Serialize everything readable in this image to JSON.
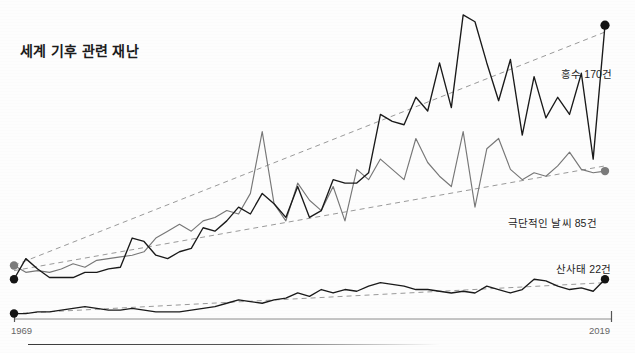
{
  "chart_title": "세계 기후 관련 재난",
  "axis": {
    "start_year_label": "1969",
    "end_year_label": "2019",
    "xlim": [
      1969,
      2019
    ],
    "ylim": [
      0,
      180
    ]
  },
  "labels": {
    "flood": "홍수 170건",
    "extreme_weather": "극단적인 날씨 85건",
    "landslide": "산사태 22건"
  },
  "colors": {
    "flood_line": "#1a1a1a",
    "extreme_weather_line": "#777777",
    "landslide_line": "#1a1a1a",
    "trend_line": "#9a9a9a",
    "axis_text": "#666666",
    "title_text": "#1b1b1b",
    "background": "#fdfdfd"
  },
  "chart_data": {
    "type": "line",
    "title": "세계 기후 관련 재난",
    "xlabel": "",
    "ylabel": "",
    "xlim": [
      1969,
      2019
    ],
    "ylim": [
      0,
      180
    ],
    "grid": false,
    "legend_position": "right-inline-endpoint-labels",
    "x": [
      1969,
      1970,
      1971,
      1972,
      1973,
      1974,
      1975,
      1976,
      1977,
      1978,
      1979,
      1980,
      1981,
      1982,
      1983,
      1984,
      1985,
      1986,
      1987,
      1988,
      1989,
      1990,
      1991,
      1992,
      1993,
      1994,
      1995,
      1996,
      1997,
      1998,
      1999,
      2000,
      2001,
      2002,
      2003,
      2004,
      2005,
      2006,
      2007,
      2008,
      2009,
      2010,
      2011,
      2012,
      2013,
      2014,
      2015,
      2016,
      2017,
      2018,
      2019
    ],
    "series": [
      {
        "name": "홍수",
        "label": "홍수 170건",
        "end_value": 170,
        "color": "#1a1a1a",
        "values": [
          22,
          34,
          28,
          23,
          23,
          23,
          26,
          26,
          28,
          29,
          46,
          44,
          36,
          34,
          38,
          40,
          52,
          50,
          56,
          64,
          60,
          72,
          66,
          58,
          76,
          58,
          62,
          80,
          78,
          78,
          84,
          118,
          114,
          112,
          128,
          120,
          148,
          122,
          176,
          172,
          148,
          126,
          150,
          106,
          140,
          116,
          128,
          118,
          142,
          92,
          170
        ]
      },
      {
        "name": "극단적인 날씨",
        "label": "극단적인 날씨 85건",
        "end_value": 85,
        "color": "#777777",
        "values": [
          30,
          26,
          27,
          26,
          28,
          31,
          29,
          33,
          34,
          35,
          36,
          38,
          46,
          50,
          54,
          50,
          56,
          58,
          62,
          60,
          72,
          108,
          66,
          56,
          78,
          68,
          62,
          76,
          56,
          86,
          80,
          92,
          86,
          80,
          104,
          90,
          82,
          76,
          108,
          64,
          98,
          104,
          86,
          80,
          84,
          82,
          88,
          96,
          86,
          84,
          85
        ]
      },
      {
        "name": "산사태",
        "label": "산사태 22건",
        "end_value": 22,
        "color": "#1a1a1a",
        "values": [
          2,
          2,
          3,
          3,
          4,
          5,
          6,
          5,
          4,
          4,
          5,
          4,
          3,
          3,
          3,
          4,
          5,
          6,
          8,
          10,
          9,
          8,
          10,
          11,
          14,
          12,
          16,
          14,
          16,
          15,
          18,
          20,
          19,
          18,
          16,
          16,
          15,
          14,
          15,
          14,
          18,
          16,
          14,
          16,
          22,
          21,
          18,
          16,
          17,
          15,
          22
        ]
      }
    ],
    "trend_lines": [
      {
        "series": "홍수",
        "start_value": 30,
        "end_value": 166
      },
      {
        "series": "극단적인 날씨",
        "start_value": 27,
        "end_value": 88
      },
      {
        "series": "산사태",
        "start_value": 2,
        "end_value": 20
      }
    ]
  }
}
